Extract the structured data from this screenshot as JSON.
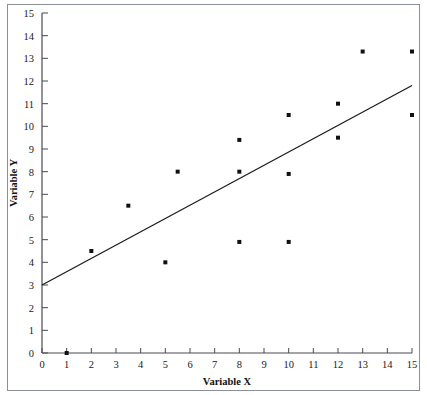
{
  "chart_data": {
    "type": "scatter",
    "title": "",
    "xlabel": "Variable X",
    "ylabel": "Variable Y",
    "xlim": [
      0,
      15
    ],
    "ylim": [
      0,
      15
    ],
    "xticks": [
      0,
      1,
      2,
      3,
      4,
      5,
      6,
      7,
      8,
      9,
      10,
      11,
      12,
      13,
      14,
      15
    ],
    "yticks": [
      0,
      1,
      2,
      3,
      4,
      5,
      6,
      7,
      8,
      9,
      10,
      11,
      12,
      13,
      14,
      15
    ],
    "xtick_labels": [
      "0",
      "1",
      "2",
      "3",
      "4",
      "5",
      "6",
      "7",
      "8",
      "9",
      "10",
      "11",
      "12",
      "13",
      "14",
      "15"
    ],
    "ytick_labels": [
      "0",
      "1",
      "2",
      "3",
      "4",
      "5",
      "6",
      "7",
      "8",
      "9",
      "10",
      "11",
      "12",
      "13",
      "14",
      "15"
    ],
    "grid": false,
    "legend": false,
    "legend_position": "none",
    "marker": "square",
    "marker_color": "#111111",
    "points": [
      {
        "x": 1,
        "y": 0
      },
      {
        "x": 2,
        "y": 4.5
      },
      {
        "x": 3.5,
        "y": 6.5
      },
      {
        "x": 5,
        "y": 4
      },
      {
        "x": 5.5,
        "y": 8
      },
      {
        "x": 8,
        "y": 9.4
      },
      {
        "x": 8,
        "y": 8
      },
      {
        "x": 8,
        "y": 4.9
      },
      {
        "x": 10,
        "y": 10.5
      },
      {
        "x": 10,
        "y": 7.9
      },
      {
        "x": 10,
        "y": 4.9
      },
      {
        "x": 12,
        "y": 11
      },
      {
        "x": 12,
        "y": 9.5
      },
      {
        "x": 13,
        "y": 13.3
      },
      {
        "x": 15,
        "y": 13.3
      },
      {
        "x": 15,
        "y": 10.5
      }
    ],
    "trendline": {
      "x0": 0,
      "y0": 3,
      "x1": 15,
      "y1": 11.8,
      "color": "#1c1c1c"
    }
  }
}
